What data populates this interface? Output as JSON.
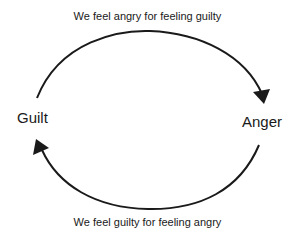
{
  "diagram": {
    "type": "cycle",
    "nodes": [
      {
        "id": "guilt",
        "label": "Guilt"
      },
      {
        "id": "anger",
        "label": "Anger"
      }
    ],
    "edges": [
      {
        "from": "guilt",
        "to": "anger",
        "label": "We feel angry for feeling guilty",
        "position": "top"
      },
      {
        "from": "anger",
        "to": "guilt",
        "label": "We feel guilty for feeling angry",
        "position": "bottom"
      }
    ],
    "colors": {
      "stroke": "#1a1a1a",
      "text": "#1a1a1a",
      "background": "#ffffff"
    }
  }
}
